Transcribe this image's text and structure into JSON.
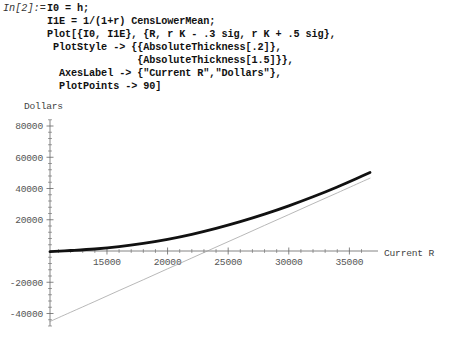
{
  "input_cell": {
    "prompt_label": "In[2]:=",
    "lines": [
      "I0 = h;",
      "I1E = 1/(1+r) CensLowerMean;",
      "Plot[{I0, I1E}, {R, r K - .3 sig, r K + .5 sig},",
      " PlotStyle -> {{AbsoluteThickness[.2]},",
      "               {AbsoluteThickness[1.5]}},",
      "  AxesLabel -> {\"Current R\",\"Dollars\"},",
      "  PlotPoints -> 90]"
    ]
  },
  "chart_data": {
    "type": "line",
    "title": "",
    "xlabel": "Current R",
    "ylabel": "Dollars",
    "xlim": [
      10300,
      36700
    ],
    "ylim": [
      -48000,
      84000
    ],
    "grid": false,
    "legend": false,
    "x_ticks": [
      15000,
      20000,
      25000,
      30000,
      35000
    ],
    "x_tick_labels": [
      "15000",
      "20000",
      "25000",
      "30000",
      "35000"
    ],
    "y_ticks": [
      80000,
      60000,
      40000,
      20000,
      -20000,
      -40000
    ],
    "y_tick_labels": [
      "80000",
      "60000",
      "40000",
      "20000",
      "-20000",
      "-40000"
    ],
    "x_minor_tick_step": 1000,
    "y_minor_tick_step": 4000,
    "axis_origin": [
      10300,
      0
    ],
    "series": [
      {
        "name": "I0",
        "style": "AbsoluteThickness[.2]",
        "thickness": 0.2,
        "color": "#999999",
        "x": [
          10300,
          12000,
          14000,
          16000,
          18000,
          20000,
          22000,
          24000,
          26000,
          28000,
          30000,
          32000,
          34000,
          36000,
          36700
        ],
        "y": [
          -45100,
          -39200,
          -32300,
          -25300,
          -18400,
          -11400,
          -4500,
          2500,
          9400,
          16400,
          23300,
          30300,
          37200,
          44200,
          46600
        ]
      },
      {
        "name": "I1E",
        "style": "AbsoluteThickness[1.5]",
        "thickness": 1.5,
        "color": "#111111",
        "x": [
          10300,
          12000,
          14000,
          16000,
          18000,
          20000,
          22000,
          24000,
          26000,
          28000,
          30000,
          32000,
          34000,
          36000,
          36700
        ],
        "y": [
          -400,
          300,
          1300,
          2800,
          4900,
          7500,
          10700,
          14500,
          18800,
          23600,
          28900,
          34700,
          41000,
          47800,
          50200
        ]
      }
    ]
  },
  "colors": {
    "background": "#ffffff",
    "axis": "#666666",
    "tick_label": "#555555",
    "thin_curve": "#999999",
    "thick_curve": "#111111",
    "code_text": "#111111",
    "prompt_text": "#333333"
  }
}
